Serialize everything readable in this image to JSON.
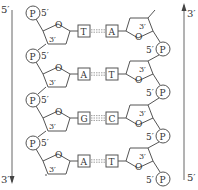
{
  "diagram": {
    "left_strand": {
      "top_label": "5′",
      "bottom_label": "3′",
      "direction": "down",
      "nucleotides": [
        {
          "phosphate": "P",
          "p_label": "5′",
          "ring_o": "O",
          "c3_label": "3′",
          "base": "T"
        },
        {
          "phosphate": "P",
          "p_label": "5′",
          "ring_o": "O",
          "c3_label": "3′",
          "base": "A"
        },
        {
          "phosphate": "P",
          "p_label": "5′",
          "ring_o": "O",
          "c3_label": "3′",
          "base": "G"
        },
        {
          "phosphate": "P",
          "p_label": "5′",
          "ring_o": "O",
          "c3_label": "3′",
          "base": "A"
        }
      ]
    },
    "right_strand": {
      "top_label": "3′",
      "bottom_label": "5′",
      "direction": "up",
      "nucleotides": [
        {
          "phosphate": "P",
          "p_label": "5′",
          "ring_o": "O",
          "c3_label": "3′",
          "base": "A"
        },
        {
          "phosphate": "P",
          "p_label": "5′",
          "ring_o": "O",
          "c3_label": "3′",
          "base": "T"
        },
        {
          "phosphate": "P",
          "p_label": "5′",
          "ring_o": "O",
          "c3_label": "3′",
          "base": "C"
        },
        {
          "phosphate": "P",
          "p_label": "5′",
          "ring_o": "O",
          "c3_label": "3′",
          "base": "T"
        }
      ]
    },
    "base_pairs": [
      {
        "left": "T",
        "right": "A",
        "hydrogen_bonds": 2
      },
      {
        "left": "A",
        "right": "T",
        "hydrogen_bonds": 2
      },
      {
        "left": "G",
        "right": "C",
        "hydrogen_bonds": 3
      },
      {
        "left": "A",
        "right": "T",
        "hydrogen_bonds": 2
      }
    ],
    "colors": {
      "line": "#555555",
      "text": "#333333",
      "background": "#ffffff"
    }
  }
}
